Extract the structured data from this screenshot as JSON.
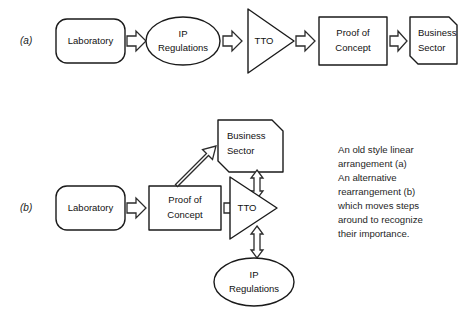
{
  "figure": {
    "background_color": "#ffffff",
    "stroke_color": "#1a1a1a",
    "text_color": "#111111"
  },
  "rows": [
    {
      "tag": "(a)",
      "description": "An old style linear arrangement",
      "nodes": [
        {
          "id": "lab-a",
          "shape": "rounded-rectangle",
          "line1": "Laboratory",
          "line2": ""
        },
        {
          "id": "ip-a",
          "shape": "ellipse",
          "line1": "IP",
          "line2": "Regulations"
        },
        {
          "id": "tto-a",
          "shape": "triangle-right",
          "line1": "TTO",
          "line2": ""
        },
        {
          "id": "poc-a",
          "shape": "rectangle",
          "line1": "Proof of",
          "line2": "Concept"
        },
        {
          "id": "business-a",
          "shape": "chamfered-box",
          "line1": "Business",
          "line2": "Sector"
        }
      ],
      "connectors": [
        {
          "from": "lab-a",
          "to": "ip-a",
          "kind": "block-arrow",
          "direction": "right"
        },
        {
          "from": "ip-a",
          "to": "tto-a",
          "kind": "block-arrow",
          "direction": "right"
        },
        {
          "from": "tto-a",
          "to": "poc-a",
          "kind": "block-arrow",
          "direction": "right"
        },
        {
          "from": "poc-a",
          "to": "business-a",
          "kind": "block-arrow",
          "direction": "right"
        }
      ]
    },
    {
      "tag": "(b)",
      "description": "An alternative rearrangement",
      "nodes": [
        {
          "id": "lab-b",
          "shape": "rounded-rectangle",
          "line1": "Laboratory",
          "line2": ""
        },
        {
          "id": "poc-b",
          "shape": "rectangle",
          "line1": "Proof of",
          "line2": "Concept"
        },
        {
          "id": "tto-b",
          "shape": "triangle-right",
          "line1": "TTO",
          "line2": ""
        },
        {
          "id": "business-b",
          "shape": "chamfered-box",
          "line1": "Business",
          "line2": "Sector"
        },
        {
          "id": "ip-b",
          "shape": "ellipse",
          "line1": "IP",
          "line2": "Regulations"
        }
      ],
      "connectors": [
        {
          "from": "lab-b",
          "to": "poc-b",
          "kind": "block-arrow",
          "direction": "right"
        },
        {
          "from": "poc-b",
          "to": "business-b",
          "kind": "block-arrow",
          "direction": "up-right"
        },
        {
          "from": "poc-b",
          "to": "tto-b",
          "kind": "block-arrow",
          "direction": "right"
        },
        {
          "from": "business-b",
          "to": "tto-b",
          "kind": "double-block-arrow",
          "direction": "vertical"
        },
        {
          "from": "tto-b",
          "to": "ip-b",
          "kind": "double-block-arrow",
          "direction": "vertical"
        }
      ]
    }
  ],
  "caption": {
    "lines": [
      "An old style linear",
      "arrangement (a)",
      "An alternative",
      "rearrangement (b)",
      "which moves steps",
      "around to recognize",
      "their importance."
    ]
  }
}
